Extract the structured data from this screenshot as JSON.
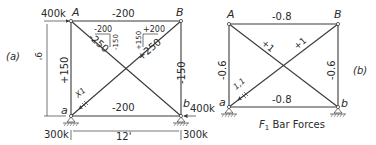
{
  "diagram_a": {
    "label": "(a)",
    "height_dim": "9'",
    "width_dim": "12'",
    "nodes": {
      "A": "A",
      "B": "B",
      "a": "a",
      "b": "b"
    },
    "loads": {
      "A_horizontal": "400k",
      "a_vertical": "300k",
      "b_horizontal": "400k",
      "b_vertical": "300k"
    },
    "members": {
      "AB": "-200",
      "ab": "-200",
      "Aa": "+150",
      "Bb": "-150",
      "Ab": "-250",
      "aB": "+250"
    },
    "components": {
      "Ab_horizontal": "-200",
      "Ab_vertical": "-150",
      "aB_horizontal": "+200",
      "aB_vertical": "+150"
    },
    "unit_load_label": "X1"
  },
  "diagram_b": {
    "label": "(b)",
    "caption": "F1 Bar Forces",
    "caption_main": "F",
    "caption_sub": "1",
    "caption_rest": " Bar Forces",
    "nodes": {
      "A": "A",
      "B": "B",
      "a": "a",
      "b": "b"
    },
    "members": {
      "AB": "-0.8",
      "ab": "-0.8",
      "Aa": "-0.6",
      "Bb": "-0.6",
      "Ab": "+1",
      "aB": "+1"
    },
    "unit_load_label": "1,1"
  }
}
